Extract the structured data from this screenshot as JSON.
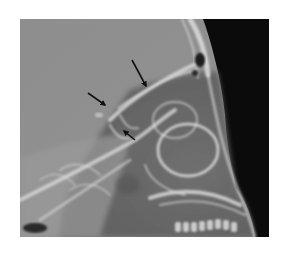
{
  "figure": {
    "type": "radiograph",
    "view": "lateral skull",
    "alt": "Lateral skull radiograph with three black arrows",
    "colors": {
      "background": "#ffffff",
      "cranium": "#8c8c8c",
      "soft_tissue_dark": "#0a0a0a",
      "bone_highlight": "#e6e6e6",
      "arrow": "#111111"
    },
    "arrows": [
      {
        "id": "arrow-1",
        "tail": [
          132,
          60
        ],
        "head": [
          146,
          86
        ]
      },
      {
        "id": "arrow-2",
        "tail": [
          88,
          93
        ],
        "head": [
          105,
          105
        ]
      },
      {
        "id": "arrow-3",
        "tail": [
          135,
          140
        ],
        "head": [
          124,
          130
        ]
      }
    ]
  }
}
